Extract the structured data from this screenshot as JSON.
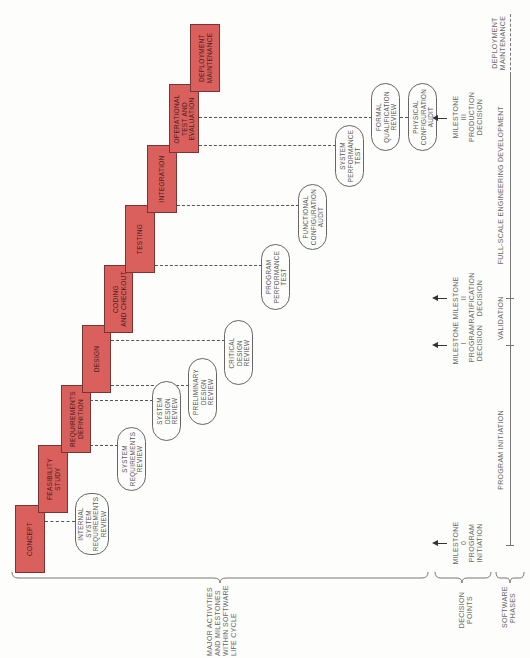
{
  "title": "Major activities and milestones within software life cycle",
  "colors": {
    "activity_fill": "#d9605c",
    "activity_border": "#7a3431",
    "line": "#555555",
    "background": "#fdfdfb"
  },
  "activities": [
    {
      "id": "concept",
      "label": "CONCEPT"
    },
    {
      "id": "feasibility",
      "label": "FEASIBILITY\nSTUDY"
    },
    {
      "id": "requirements",
      "label": "REQUIREMENTS\nDEFINITION"
    },
    {
      "id": "design",
      "label": "DESIGN"
    },
    {
      "id": "coding",
      "label": "CODING\nAND CHECKOUT"
    },
    {
      "id": "testing",
      "label": "TESTING"
    },
    {
      "id": "integration",
      "label": "INTEGRATION"
    },
    {
      "id": "operational",
      "label": "OPERATIONAL\nTEST AND\nEVALUATION"
    },
    {
      "id": "deployment",
      "label": "DEPLOYMENT\nMAINTENANCE"
    }
  ],
  "reviews": [
    {
      "id": "isrr",
      "label": "INTERNAL\nSYSTEM\nREQUIREMENTS\nREVIEW"
    },
    {
      "id": "srr",
      "label": "SYSTEM\nREQUIREMENTS\nREVIEW"
    },
    {
      "id": "sdr",
      "label": "SYSTEM\nDESIGN\nREVIEW"
    },
    {
      "id": "pdr",
      "label": "PRELIMINARY\nDESIGN\nREVIEW"
    },
    {
      "id": "cdr",
      "label": "CRITICAL\nDESIGN\nREVIEW"
    },
    {
      "id": "ppt",
      "label": "PROGRAM\nPERFORMANCE\nTEST"
    },
    {
      "id": "fca",
      "label": "FUNCTIONAL\nCONFIGURATION\nAUDIT"
    },
    {
      "id": "spt",
      "label": "SYSTEM\nPERFORMANCE\nTEST"
    },
    {
      "id": "fqr",
      "label": "FORMAL\nQUALIFICATION\nREVIEW"
    },
    {
      "id": "pca",
      "label": "PHYSICAL\nCONFIGURATION\nAUDIT"
    }
  ],
  "milestones": [
    {
      "id": "m0",
      "label": "MILESTONE\n0\nPROGRAM\nINITIATION"
    },
    {
      "id": "m1",
      "label": "MILESTONE\nI\nPROGRAM\nDECISION"
    },
    {
      "id": "m2",
      "label": "MILESTONE\nII\nRATIFICATION\nDECISION"
    },
    {
      "id": "m3",
      "label": "MILESTONE\nIII\nPRODUCTION\nDECISION"
    }
  ],
  "phases": [
    {
      "id": "program_initiation",
      "label": "PROGRAM INITIATION"
    },
    {
      "id": "validation",
      "label": "VALIDATION"
    },
    {
      "id": "fsed",
      "label": "FULL-SCALE ENGINEERING DEVELOPMENT"
    },
    {
      "id": "deployment_maintenance",
      "label": "DEPLOYMENT\nMAINTENANCE"
    }
  ],
  "row_labels": {
    "activities": "MAJOR ACTIVITIES\nAND MILESTONES\nWITHIN SOFTWARE\nLIFE CYCLE",
    "decision_points": "DECISION\nPOINTS",
    "software_phases": "SOFTWARE\nPHASES"
  }
}
